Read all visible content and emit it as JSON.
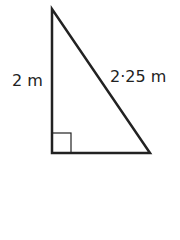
{
  "diagram": {
    "type": "right-triangle",
    "vertical_side": {
      "label": "2 m"
    },
    "hypotenuse": {
      "label": "2·25 m"
    },
    "right_angle_marker": true,
    "colors": {
      "stroke": "#222222",
      "background": "#ffffff"
    }
  }
}
